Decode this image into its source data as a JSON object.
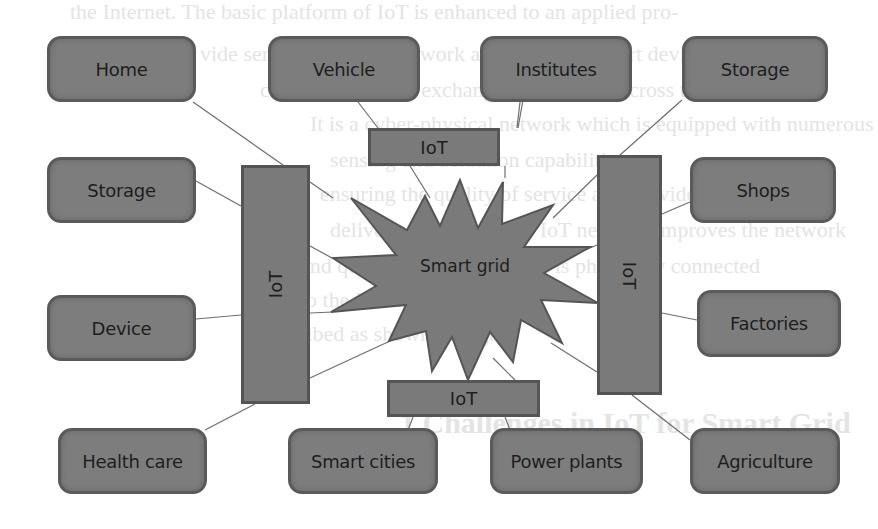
{
  "diagram": {
    "hub": {
      "label": "Smart grid",
      "shape": "starburst",
      "fill": "#7a7a7a"
    },
    "iot_layers": {
      "top": "IoT",
      "bottom": "IoT",
      "left": "IoT",
      "right": "IoT"
    },
    "nodes": {
      "top": [
        "Home",
        "Vehicle",
        "Institutes",
        "Storage"
      ],
      "left": [
        "Storage",
        "Device"
      ],
      "right": [
        "Shops",
        "Factories"
      ],
      "bottom": [
        "Health care",
        "Smart cities",
        "Power plants",
        "Agriculture"
      ]
    },
    "colors": {
      "node_fill": "#7d7d7d",
      "node_border": "#5a5a5a",
      "text": "#1e1e1e",
      "connector": "#6e6e6e",
      "background": "#ffffff"
    }
  },
  "background_text": {
    "lines": [
      "the Internet. The basic platform of IoT is enhanced to an applied pro-",
      "vide service. The IoT network allows all the smart devices to",
      "communicate and exchange information across the network.",
      "It is a cyber-physical network which is equipped with numerous",
      "sensing and actuation capabilities",
      "ensuring the quality of service and provides efficient",
      "delivery of energy. The IoT network improves the network",
      "and quality of service which is physically connected",
      "to the Internet.",
      "described as shown in Figure",
      "1 Challenges in IoT for Smart Grid"
    ]
  }
}
